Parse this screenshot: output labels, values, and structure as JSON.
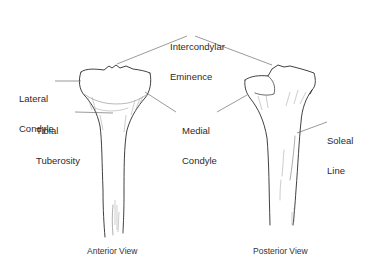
{
  "figure": {
    "labels": {
      "intercondylar_eminence": [
        "Intercondylar",
        "Eminence"
      ],
      "lateral_condyle": [
        "Lateral",
        "Condyle"
      ],
      "tibial_tuberosity": [
        "Tibial",
        "Tuberosity"
      ],
      "medial_condyle": [
        "Medial",
        "Condyle"
      ],
      "soleal_line": [
        "Soleal",
        "Line"
      ]
    },
    "captions": {
      "anterior": "Anterior View",
      "posterior": "Posterior View"
    },
    "colors": {
      "line": "#2b2b2b",
      "leader": "#555555",
      "shade": "#9a9a9a",
      "background": "#ffffff"
    }
  }
}
